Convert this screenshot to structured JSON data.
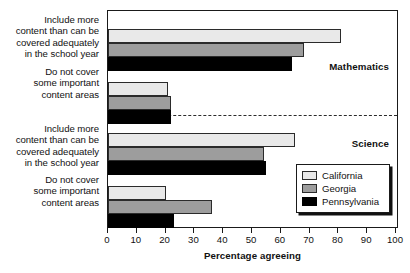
{
  "chart_data": {
    "type": "bar",
    "orientation": "horizontal",
    "title": "",
    "xlabel": "Percentage agreeing",
    "ylabel": "",
    "xlim": [
      0,
      100
    ],
    "xticks": [
      0,
      10,
      20,
      30,
      40,
      50,
      60,
      70,
      80,
      90,
      100
    ],
    "grid": false,
    "legend_position": "lower right",
    "legend_entries": [
      "California",
      "Georgia",
      "Pennsylvania"
    ],
    "series": [
      {
        "name": "California",
        "color": "#e9e9e9",
        "values": [
          81,
          21,
          65,
          20
        ]
      },
      {
        "name": "Georgia",
        "color": "#9d9d9d",
        "values": [
          68,
          22,
          54,
          36
        ]
      },
      {
        "name": "Pennsylvania",
        "color": "#000000",
        "values": [
          64,
          22,
          55,
          23
        ]
      }
    ],
    "categories": [
      "Include more content than can be covered adequately in the school year",
      "Do not cover some important content areas",
      "Include more content than can be covered adequately in the school year",
      "Do not cover some important content areas"
    ],
    "panels": [
      {
        "label": "Mathematics",
        "categories": [
          0,
          1
        ]
      },
      {
        "label": "Science",
        "categories": [
          2,
          3
        ]
      }
    ],
    "annotations": [
      "Mathematics",
      "Science"
    ]
  },
  "axis": {
    "x_title": "Percentage agreeing",
    "tick_labels": [
      "0",
      "10",
      "20",
      "30",
      "40",
      "50",
      "60",
      "70",
      "80",
      "90",
      "100"
    ]
  },
  "categories": [
    {
      "lines": [
        "Include more",
        "content than can be",
        "covered adequately",
        "in the school year"
      ]
    },
    {
      "lines": [
        "Do not cover",
        "some important",
        "content areas"
      ]
    },
    {
      "lines": [
        "Include more",
        "content than can be",
        "covered adequately",
        "in the school year"
      ]
    },
    {
      "lines": [
        "Do not cover",
        "some important",
        "content areas"
      ]
    }
  ],
  "panels": [
    {
      "label": "Mathematics"
    },
    {
      "label": "Science"
    }
  ],
  "legend": {
    "items": [
      {
        "label": "California",
        "swatch": "california"
      },
      {
        "label": "Georgia",
        "swatch": "georgia"
      },
      {
        "label": "Pennsylvania",
        "swatch": "pennsylvania"
      }
    ]
  }
}
